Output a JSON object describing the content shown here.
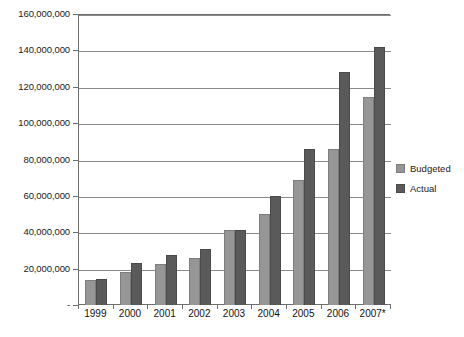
{
  "chart_data": {
    "type": "bar",
    "title": "",
    "subtitle": "",
    "xlabel": "",
    "ylabel": "",
    "categories": [
      "1999",
      "2000",
      "2001",
      "2002",
      "2003",
      "2004",
      "2005",
      "2006",
      "2007*"
    ],
    "series": [
      {
        "name": "Budgeted",
        "color": "#969696",
        "values": [
          14000000,
          18000000,
          22500000,
          26000000,
          41000000,
          50000000,
          69000000,
          86000000,
          114500000
        ]
      },
      {
        "name": "Actual",
        "color": "#5a5a5a",
        "values": [
          14500000,
          23000000,
          27500000,
          31000000,
          41000000,
          60000000,
          86000000,
          128000000,
          142000000
        ]
      }
    ],
    "ylim": [
      0,
      160000000
    ],
    "ytick_values": [
      0,
      20000000,
      40000000,
      60000000,
      80000000,
      100000000,
      120000000,
      140000000,
      160000000
    ],
    "ytick_labels": [
      "-",
      "20,000,000",
      "40,000,000",
      "60,000,000",
      "80,000,000",
      "100,000,000",
      "120,000,000",
      "140,000,000",
      "160,000,000"
    ],
    "grid": true,
    "grid_axis": "y",
    "legend_position": "right",
    "legend_entries": [
      "Budgeted",
      "Actual"
    ],
    "annotations": []
  }
}
